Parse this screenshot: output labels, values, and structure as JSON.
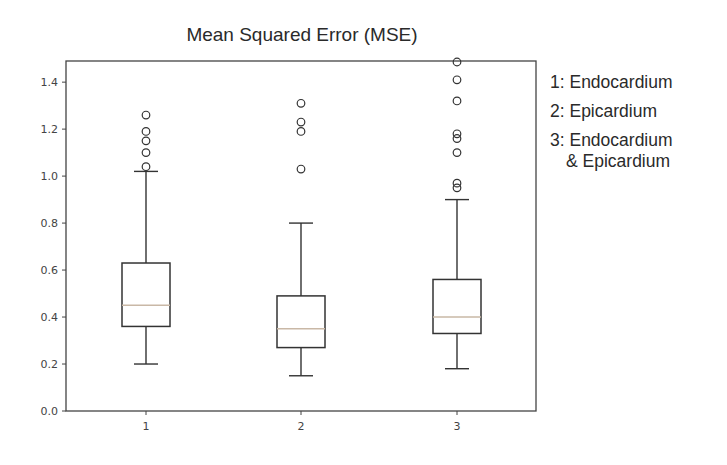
{
  "chart_data": {
    "type": "boxplot",
    "title": "Mean Squared Error (MSE)",
    "xlabel": "",
    "ylabel": "",
    "categories": [
      "1",
      "2",
      "3"
    ],
    "ylim": [
      0.0,
      1.49
    ],
    "yticks": [
      0.0,
      0.2,
      0.4,
      0.6,
      0.8,
      1.0,
      1.2,
      1.4
    ],
    "ytick_labels": [
      "0.0",
      "0.2",
      "0.4",
      "0.6",
      "0.8",
      "1.0",
      "1.2",
      "1.4"
    ],
    "grid": false,
    "legend_position": "right (text annotation)",
    "series": [
      {
        "name": "1",
        "whisker_low": 0.2,
        "q1": 0.36,
        "median": 0.45,
        "q3": 0.63,
        "whisker_high": 1.02,
        "outliers": [
          1.04,
          1.1,
          1.15,
          1.19,
          1.26
        ]
      },
      {
        "name": "2",
        "whisker_low": 0.15,
        "q1": 0.27,
        "median": 0.35,
        "q3": 0.49,
        "whisker_high": 0.8,
        "outliers": [
          1.03,
          1.19,
          1.23,
          1.31
        ]
      },
      {
        "name": "3",
        "whisker_low": 0.18,
        "q1": 0.33,
        "median": 0.4,
        "q3": 0.56,
        "whisker_high": 0.9,
        "outliers": [
          0.95,
          0.97,
          1.1,
          1.16,
          1.18,
          1.32,
          1.41,
          1.49
        ]
      }
    ],
    "annotations": [
      "1: Endocardium",
      "2: Epicardium",
      "3: Endocardium & Epicardium"
    ]
  },
  "legend": {
    "items": [
      {
        "label": "1: Endocardium"
      },
      {
        "label": "2: Epicardium"
      },
      {
        "label": "3: Endocardium",
        "cont": "& Epicardium"
      }
    ]
  },
  "colors": {
    "box": "#333333",
    "median": "#c9b8a6",
    "axis": "#444444"
  }
}
